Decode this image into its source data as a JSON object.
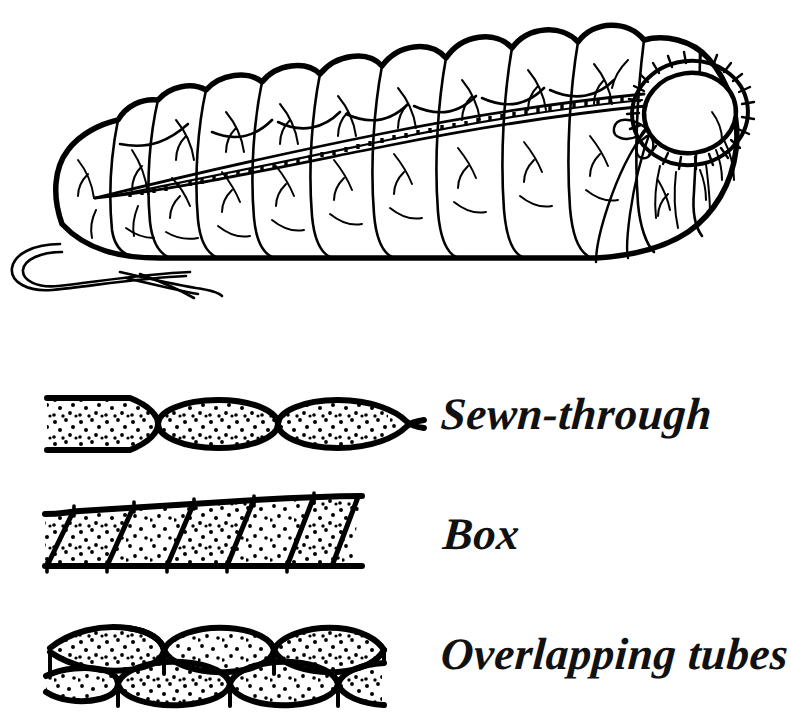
{
  "figure": {
    "background_color": "#ffffff",
    "ink_color": "#000000",
    "style": "pen-and-ink line drawing"
  },
  "illustration": {
    "name": "down sleeping bag",
    "description": "Mummy-style down sleeping bag drawn in perspective with lofted tube baffles, a side zipper running from the foot up to the hood, a gathered drawstring hood collar with tie, and a draw cord loop at the foot end.",
    "parts": [
      {
        "name": "hood-opening",
        "label": "hood opening"
      },
      {
        "name": "drawstring-collar",
        "label": "drawstring collar"
      },
      {
        "name": "drawstring-tie",
        "label": "drawstring tie"
      },
      {
        "name": "zipper",
        "label": "zipper"
      },
      {
        "name": "foot-cord",
        "label": "foot cord"
      },
      {
        "name": "baffle-tubes",
        "label": "baffle tubes"
      }
    ],
    "baffle_tube_count": 12
  },
  "diagrams": [
    {
      "id": "sewn-through",
      "label": "Sewn-through",
      "description": "Top and bottom shell fabrics stitched directly together at intervals, forming lens-shaped chambers with cold-spot seams where no insulation sits.",
      "chamber_count": 3,
      "fill": "down (stippled dots)",
      "cold_spots": true
    },
    {
      "id": "box",
      "label": "Box",
      "description": "Slanted internal fabric walls connect the top and bottom shells, forming continuous parallelogram chambers of even loft with no stitched-through cold spots.",
      "chamber_count": 5,
      "fill": "down (stippled dots)",
      "cold_spots": false
    },
    {
      "id": "overlapping-tubes",
      "label": "Overlapping tubes",
      "description": "Two staggered layers of lens-shaped tubes offset so that the seams of one layer are covered by the loft of the other, eliminating cold spots.",
      "chamber_count": 7,
      "layers": 2,
      "fill": "down (stippled dots)",
      "cold_spots": false
    }
  ]
}
